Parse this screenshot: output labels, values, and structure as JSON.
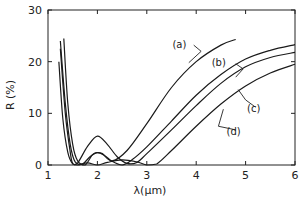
{
  "chart_data": {
    "type": "line",
    "title": "",
    "xlabel": "λ(μm)",
    "ylabel": "R (%)",
    "xlim": [
      1,
      6
    ],
    "ylim": [
      0,
      30
    ],
    "grid": false,
    "legend": "inline annotations",
    "x_ticks": [
      "1",
      "2",
      "3",
      "4",
      "5",
      "6"
    ],
    "y_ticks": [
      "0",
      "10",
      "20",
      "30"
    ],
    "series": [
      {
        "name": "(a)",
        "x": [
          1.32,
          1.4,
          1.5,
          1.6,
          1.75,
          1.9,
          2.0,
          2.1,
          2.3,
          2.6,
          3.0,
          3.5,
          4.0,
          4.5,
          4.8
        ],
        "y": [
          24.5,
          12.0,
          4.0,
          0.8,
          0.0,
          2.0,
          2.4,
          2.2,
          0.8,
          2.8,
          8.0,
          15.0,
          20.0,
          23.2,
          24.3
        ]
      },
      {
        "name": "(b)",
        "x": [
          1.25,
          1.35,
          1.45,
          1.55,
          1.7,
          1.85,
          2.0,
          2.15,
          2.3,
          2.5,
          2.7,
          3.0,
          3.5,
          4.0,
          4.5,
          5.0,
          5.5,
          6.0
        ],
        "y": [
          24.0,
          12.0,
          4.0,
          0.6,
          0.2,
          1.6,
          2.4,
          1.8,
          0.7,
          0.0,
          1.0,
          3.5,
          8.5,
          13.5,
          17.5,
          20.5,
          22.2,
          23.3
        ]
      },
      {
        "name": "(c)",
        "x": [
          1.25,
          1.35,
          1.45,
          1.5,
          1.6,
          1.8,
          2.0,
          2.2,
          2.4,
          2.6,
          2.8,
          3.0,
          3.5,
          4.0,
          4.5,
          5.0,
          5.5,
          6.0
        ],
        "y": [
          22.5,
          10.0,
          2.5,
          0.3,
          0.4,
          3.6,
          5.6,
          4.0,
          1.6,
          0.3,
          0.5,
          2.2,
          6.8,
          11.5,
          15.8,
          19.0,
          20.8,
          21.8
        ]
      },
      {
        "name": "(d)",
        "x": [
          1.22,
          1.3,
          1.4,
          1.5,
          1.6,
          1.8,
          2.0,
          2.2,
          2.5,
          2.8,
          3.0,
          3.2,
          3.5,
          4.0,
          4.5,
          5.0,
          5.5,
          6.0
        ],
        "y": [
          20.0,
          9.0,
          2.5,
          0.2,
          0.0,
          0.4,
          0.0,
          0.5,
          1.0,
          0.6,
          0.0,
          0.2,
          2.8,
          7.5,
          11.8,
          15.3,
          17.8,
          19.5
        ]
      }
    ],
    "annotations": [
      {
        "text": "(a)",
        "x": 3.8,
        "y": 23.5
      },
      {
        "text": "(b)",
        "x": 4.6,
        "y": 20.0
      },
      {
        "text": "(c)",
        "x": 5.3,
        "y": 11.0
      },
      {
        "text": "(d)",
        "x": 4.9,
        "y": 6.5
      }
    ]
  }
}
